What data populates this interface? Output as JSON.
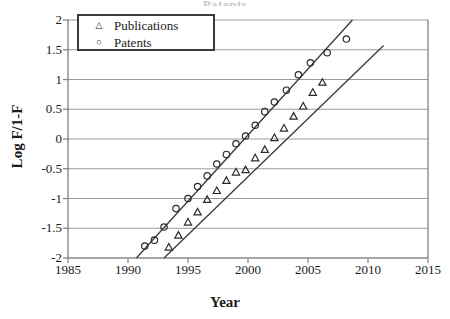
{
  "chart_data": {
    "type": "scatter",
    "title": "Patents",
    "xlabel": "Year",
    "ylabel": "Log F/1-F",
    "xlim": [
      1985,
      2015
    ],
    "ylim": [
      -2,
      2
    ],
    "xticks": [
      1985,
      1990,
      1995,
      2000,
      2005,
      2010,
      2015
    ],
    "yticks": [
      -2,
      -1.5,
      -1,
      -0.5,
      0,
      0.5,
      1,
      1.5,
      2
    ],
    "grid": "horizontal",
    "legend_position": "top-left",
    "series": [
      {
        "name": "Publications",
        "marker": "triangle",
        "points": [
          {
            "x": 1993.4,
            "y": -1.82
          },
          {
            "x": 1994.2,
            "y": -1.62
          },
          {
            "x": 1995.0,
            "y": -1.4
          },
          {
            "x": 1995.8,
            "y": -1.23
          },
          {
            "x": 1996.6,
            "y": -1.02
          },
          {
            "x": 1997.4,
            "y": -0.87
          },
          {
            "x": 1998.2,
            "y": -0.7
          },
          {
            "x": 1999.0,
            "y": -0.56
          },
          {
            "x": 1999.8,
            "y": -0.52
          },
          {
            "x": 2000.6,
            "y": -0.32
          },
          {
            "x": 2001.4,
            "y": -0.18
          },
          {
            "x": 2002.2,
            "y": 0.02
          },
          {
            "x": 2003.0,
            "y": 0.18
          },
          {
            "x": 2003.8,
            "y": 0.38
          },
          {
            "x": 2004.6,
            "y": 0.55
          },
          {
            "x": 2005.4,
            "y": 0.78
          },
          {
            "x": 2006.2,
            "y": 0.95
          }
        ],
        "fit_line": {
          "x1": 1993.0,
          "y1": -2.0,
          "x2": 2011.3,
          "y2": 1.57
        }
      },
      {
        "name": "Patents",
        "marker": "circle",
        "points": [
          {
            "x": 1991.4,
            "y": -1.8
          },
          {
            "x": 1992.2,
            "y": -1.7
          },
          {
            "x": 1993.0,
            "y": -1.48
          },
          {
            "x": 1994.0,
            "y": -1.17
          },
          {
            "x": 1995.0,
            "y": -1.0
          },
          {
            "x": 1995.8,
            "y": -0.8
          },
          {
            "x": 1996.6,
            "y": -0.62
          },
          {
            "x": 1997.4,
            "y": -0.42
          },
          {
            "x": 1998.2,
            "y": -0.26
          },
          {
            "x": 1999.0,
            "y": -0.08
          },
          {
            "x": 1999.8,
            "y": 0.05
          },
          {
            "x": 2000.6,
            "y": 0.23
          },
          {
            "x": 2001.4,
            "y": 0.46
          },
          {
            "x": 2002.2,
            "y": 0.62
          },
          {
            "x": 2003.2,
            "y": 0.82
          },
          {
            "x": 2004.2,
            "y": 1.08
          },
          {
            "x": 2005.2,
            "y": 1.28
          },
          {
            "x": 2006.6,
            "y": 1.45
          },
          {
            "x": 2008.2,
            "y": 1.68
          }
        ],
        "fit_line": {
          "x1": 1990.7,
          "y1": -2.0,
          "x2": 2008.7,
          "y2": 2.0
        }
      }
    ]
  },
  "legend": {
    "items": [
      {
        "label": "Publications",
        "marker_glyph": "△"
      },
      {
        "label": "Patents",
        "marker_glyph": "○"
      }
    ]
  },
  "axes": {
    "y_title": "Log F/1-F",
    "x_title": "Year",
    "y_tick_labels": [
      "2",
      "1.5",
      "1",
      "0.5",
      "0",
      "-0.5",
      "-1",
      "-1.5",
      "-2"
    ],
    "x_tick_labels": [
      "1985",
      "1990",
      "1995",
      "2000",
      "2005",
      "2010",
      "2015"
    ]
  },
  "title": {
    "text": "Patents"
  },
  "colors": {
    "axis": "#8a8a8a",
    "grid": "#9a9a9a",
    "marker": "#2b2b2b",
    "fit_line": "#3a3a3a",
    "legend_border": "#3b3b3b",
    "text": "#1a1a1a"
  }
}
